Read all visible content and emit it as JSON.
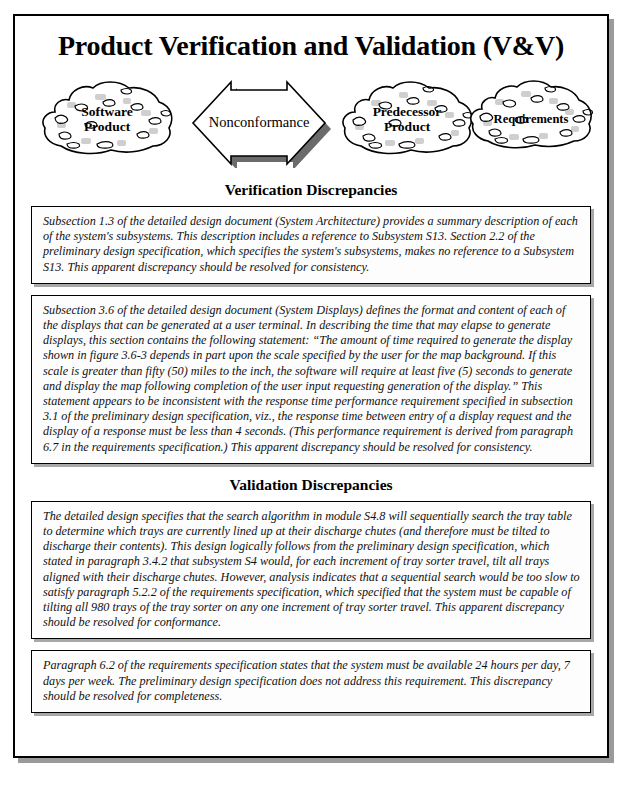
{
  "document": {
    "title": "Product Verification and Validation (V&V)"
  },
  "diagram": {
    "nodes": [
      {
        "id": "software-product",
        "label_line1": "Software",
        "label_line2": "Product",
        "shape": "rock-cloud-icon"
      },
      {
        "id": "predecessor-product",
        "label_line1": "Predecessor",
        "label_line2": "Product",
        "shape": "rock-cloud-icon"
      },
      {
        "id": "requirements",
        "label_line1": "Requirements",
        "label_line2": "",
        "shape": "rock-cloud-icon"
      }
    ],
    "connector": {
      "id": "nonconformance-arrow",
      "label": "Nonconformance",
      "shape": "double-headed-arrow-icon"
    }
  },
  "sections": [
    {
      "id": "verification",
      "heading": "Verification Discrepancies",
      "items": [
        {
          "id": "verification-item-1",
          "text": "Subsection 1.3 of the detailed design document (System Architecture) provides a summary description of each of the system's subsystems.  This description includes a reference to Subsystem S13.  Section 2.2 of the preliminary design specification, which specifies the system's subsystems, makes no reference to a Subsystem S13.  This apparent discrepancy should be resolved for consistency."
        },
        {
          "id": "verification-item-2",
          "text": "Subsection 3.6 of the detailed design document (System Displays) defines the format and content of each of the displays that can be generated at a user terminal.  In describing the time that may elapse to generate displays, this section contains the following statement:  “The amount of time required to generate the display shown in figure 3.6-3 depends in part upon the scale specified by the user for the map background.  If this scale is greater than fifty (50) miles to the inch, the software will require at least five (5) seconds to generate and display the map following completion of the user input requesting generation of the display.”  This statement appears to be inconsistent with the response time performance requirement specified in subsection 3.1 of the preliminary design specification, viz., the response time between entry of a display request and the display of a response must be less than 4 seconds.  (This performance requirement is derived from paragraph 6.7 in the requirements specification.)  This apparent discrepancy should be resolved for consistency."
        }
      ]
    },
    {
      "id": "validation",
      "heading": "Validation Discrepancies",
      "items": [
        {
          "id": "validation-item-1",
          "text": "The detailed design specifies that the search algorithm in module S4.8 will sequentially search the tray table to determine which trays are currently lined up at their discharge chutes (and therefore must be tilted to discharge their contents).  This design logically follows from the preliminary design specification, which stated in paragraph 3.4.2 that subsystem S4 would, for each increment of tray sorter travel, tilt all trays aligned with their discharge chutes.  However, analysis indicates that a sequential search would be too slow to satisfy paragraph 5.2.2 of the requirements specification, which specified that the system must be capable of tilting all 980 trays of the tray sorter on any one increment of tray sorter travel.  This apparent discrepancy should be resolved for conformance."
        },
        {
          "id": "validation-item-2",
          "text": "Paragraph 6.2 of the requirements specification states that the system must be available 24 hours per day, 7 days per week.  The preliminary design specification does not address this requirement.  This discrepancy should be resolved for completeness."
        }
      ]
    }
  ],
  "colors": {
    "ink": "#000000",
    "page_background": "#ffffff",
    "box_shadow": "#a8a8a8",
    "frame_shadow": "#9a9a9a",
    "rock_speckle_light": "#c9c9c9",
    "arrow_shadow": "#6b6b6b"
  }
}
